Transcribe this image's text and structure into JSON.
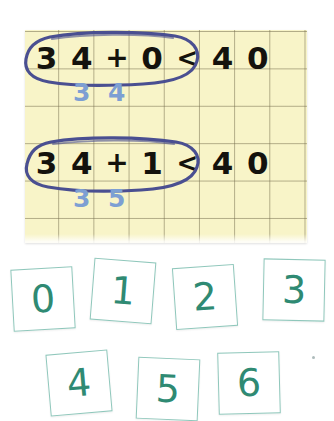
{
  "scene": {
    "description": "worksheet-photo",
    "background_color": "#ffffff"
  },
  "paper": {
    "name": "grid-paper",
    "background_color": "#f8f4c8",
    "gridline_color": "#787050",
    "columns": 8,
    "rows": 6
  },
  "equations": [
    {
      "id": "equation-row-1",
      "circled_cells": [
        "3",
        "4",
        "+",
        "0"
      ],
      "comparison": "<",
      "right_cells": [
        "4",
        "0"
      ],
      "full_text": "34 + 0 < 40",
      "answer_cells": [
        "3",
        "4"
      ],
      "answer_text": "34",
      "ink_color": "#14120d",
      "answer_color": "#7d9fd3",
      "circle_color": "#4a4f91"
    },
    {
      "id": "equation-row-2",
      "circled_cells": [
        "3",
        "4",
        "+",
        "1"
      ],
      "comparison": "<",
      "right_cells": [
        "4",
        "0"
      ],
      "full_text": "34 + 1 < 40",
      "answer_cells": [
        "3",
        "5"
      ],
      "answer_text": "35",
      "ink_color": "#14120d",
      "answer_color": "#7d9fd3",
      "circle_color": "#4a4f91"
    }
  ],
  "tiles": {
    "border_color": "#8fc7bb",
    "digit_color": "#2f8a73",
    "row1": [
      {
        "label": "0"
      },
      {
        "label": "1"
      },
      {
        "label": "2"
      },
      {
        "label": "3"
      }
    ],
    "row2": [
      {
        "label": "4"
      },
      {
        "label": "5"
      },
      {
        "label": "6"
      }
    ]
  }
}
